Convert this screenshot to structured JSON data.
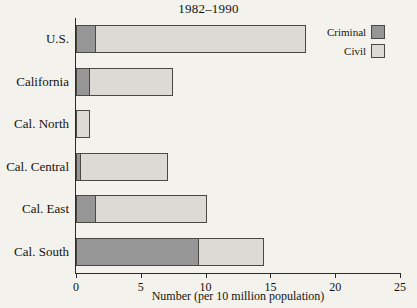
{
  "chart_data": {
    "type": "bar",
    "orientation": "horizontal",
    "stacked": true,
    "title": "1982–1990",
    "xlabel": "Number (per 10 million population)",
    "ylabel": "",
    "xlim": [
      0,
      25
    ],
    "xticks": [
      0,
      5,
      10,
      15,
      20,
      25
    ],
    "xtick_labels": [
      "0",
      "5",
      "10",
      "15",
      "20",
      "25"
    ],
    "grid": false,
    "legend_position": "top-right",
    "categories": [
      "U.S.",
      "California",
      "Cal. North",
      "Cal. Central",
      "Cal. East",
      "Cal. South"
    ],
    "series": [
      {
        "name": "Criminal",
        "color": "#969696",
        "values": [
          1.5,
          1.0,
          0.0,
          0.3,
          1.5,
          9.4
        ]
      },
      {
        "name": "Civil",
        "color": "#dcdad4",
        "values": [
          16.2,
          6.4,
          1.0,
          6.7,
          8.5,
          5.0
        ]
      }
    ],
    "totals": [
      17.7,
      7.4,
      1.0,
      7.0,
      10.0,
      14.4
    ]
  },
  "legend": {
    "items": [
      {
        "label": "Criminal",
        "color": "#969696"
      },
      {
        "label": "Civil",
        "color": "#dcdad4"
      }
    ]
  },
  "colors": {
    "background": "#f4f2ec",
    "axis": "#2c2a26",
    "bar_outline": "#4a4843",
    "criminal": "#969696",
    "civil": "#dcdad4"
  }
}
